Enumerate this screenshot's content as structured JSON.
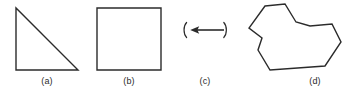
{
  "figure": {
    "background_color": "#ffffff",
    "stroke_color": "#2b2b2b",
    "width": 357,
    "height": 92,
    "panels": [
      {
        "key": "a",
        "label": "(a)",
        "shape": "right-triangle",
        "label_x": 47,
        "label_y": 76,
        "vertices": "16,8 16,70 78,70"
      },
      {
        "key": "b",
        "label": "(b)",
        "shape": "square",
        "label_x": 129,
        "label_y": 76,
        "vertices": "97,8 161,8 161,70 97,70"
      },
      {
        "key": "c",
        "label": "(c)",
        "shape": "left-arrow-in-brackets",
        "label_x": 205,
        "label_y": 76,
        "arrow_direction": "left",
        "arrow_start_x": 224,
        "arrow_end_x": 191,
        "arrow_y": 30,
        "left_bracket_x": 184,
        "right_bracket_x": 226
      },
      {
        "key": "d",
        "label": "(d)",
        "shape": "concave-polygon",
        "label_x": 315,
        "label_y": 76,
        "vertices": "265,6 285,4 296,22 310,26 332,24 341,42 325,66 270,70 258,50 262,38 249,28"
      }
    ]
  }
}
